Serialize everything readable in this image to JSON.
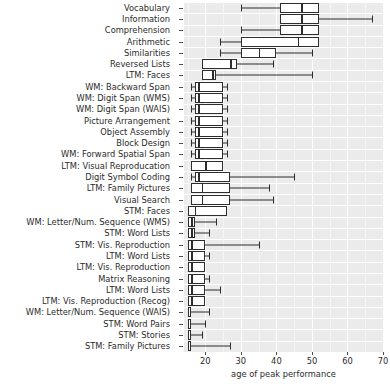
{
  "chart_data": {
    "type": "box",
    "title": "",
    "xlabel": "age of peak performance",
    "ylabel": "",
    "xlim": [
      14,
      70
    ],
    "xticks": [
      20,
      30,
      40,
      50,
      60,
      70
    ],
    "xticklabels": [
      "20",
      "30",
      "40",
      "50",
      "60",
      "70"
    ],
    "grid": true,
    "legend": "none",
    "orientation": "horizontal",
    "categories": [
      "Vocabulary",
      "Information",
      "Comprehension",
      "Arithmetic",
      "Similarities",
      "Reversed Lists",
      "LTM: Faces",
      "WM: Backward Span",
      "WM: Digit Span (WMS)",
      "WM: Digit Span (WAIS)",
      "Picture Arrangement",
      "Object Assembly",
      "Block Design",
      "WM: Forward Spatial Span",
      "LTM: Visual Reproducation",
      "Digit Symbol Coding",
      "LTM: Family Pictures",
      "Visual Search",
      "STM: Faces",
      "WM: Letter/Num. Sequence (WMS)",
      "STM: Word Lists",
      "STM: Vis. Reproduction",
      "LTM: Word Lists",
      "LTM: Vis. Reproduction",
      "Matrix Reasoning",
      "LTM: Word Lists",
      "LTM: Vis. Reproduction (Recog)",
      "WM: Letter/Num. Sequence (WAIS)",
      "STM: Word Pairs",
      "STM: Stories",
      "STM: Family Pictures"
    ],
    "boxes": [
      {
        "name": "Vocabulary",
        "whisker_low": 30,
        "q1": 41,
        "median": 47,
        "q3": 52,
        "whisker_high": 52
      },
      {
        "name": "Information",
        "whisker_low": 41,
        "q1": 41,
        "median": 47,
        "q3": 52,
        "whisker_high": 67
      },
      {
        "name": "Comprehension",
        "whisker_low": 30,
        "q1": 41,
        "median": 47,
        "q3": 52,
        "whisker_high": 52
      },
      {
        "name": "Arithmetic",
        "whisker_low": 24,
        "q1": 30,
        "median": 46,
        "q3": 52,
        "whisker_high": 52
      },
      {
        "name": "Similarities",
        "whisker_low": 24,
        "q1": 30,
        "median": 35,
        "q3": 40,
        "whisker_high": 50
      },
      {
        "name": "Reversed Lists",
        "whisker_low": 19,
        "q1": 19,
        "median": 27,
        "q3": 29,
        "whisker_high": 39
      },
      {
        "name": "LTM: Faces",
        "whisker_low": 19,
        "q1": 19,
        "median": 22,
        "q3": 23,
        "whisker_high": 50
      },
      {
        "name": "WM: Backward Span",
        "whisker_low": 16,
        "q1": 17,
        "median": 18,
        "q3": 25,
        "whisker_high": 26
      },
      {
        "name": "WM: Digit Span (WMS)",
        "whisker_low": 16,
        "q1": 17,
        "median": 18,
        "q3": 25,
        "whisker_high": 26
      },
      {
        "name": "WM: Digit Span (WAIS)",
        "whisker_low": 16,
        "q1": 17,
        "median": 18,
        "q3": 25,
        "whisker_high": 26
      },
      {
        "name": "Picture Arrangement",
        "whisker_low": 16,
        "q1": 17,
        "median": 18,
        "q3": 25,
        "whisker_high": 26
      },
      {
        "name": "Object Assembly",
        "whisker_low": 16,
        "q1": 17,
        "median": 18,
        "q3": 25,
        "whisker_high": 26
      },
      {
        "name": "Block Design",
        "whisker_low": 16,
        "q1": 17,
        "median": 18,
        "q3": 25,
        "whisker_high": 26
      },
      {
        "name": "WM: Forward Spatial Span",
        "whisker_low": 16,
        "q1": 17,
        "median": 18,
        "q3": 25,
        "whisker_high": 26
      },
      {
        "name": "LTM: Visual Reproducation",
        "whisker_low": 16,
        "q1": 16,
        "median": 20,
        "q3": 25,
        "whisker_high": 25
      },
      {
        "name": "Digit Symbol Coding",
        "whisker_low": 16,
        "q1": 17,
        "median": 18,
        "q3": 27,
        "whisker_high": 45
      },
      {
        "name": "LTM: Family Pictures",
        "whisker_low": 16,
        "q1": 16,
        "median": 19,
        "q3": 27,
        "whisker_high": 38
      },
      {
        "name": "Visual Search",
        "whisker_low": 16,
        "q1": 16,
        "median": 19,
        "q3": 27,
        "whisker_high": 39
      },
      {
        "name": "STM: Faces",
        "whisker_low": 15,
        "q1": 15,
        "median": 17,
        "q3": 26,
        "whisker_high": 26
      },
      {
        "name": "WM: Letter/Num. Sequence (WMS)",
        "whisker_low": 15,
        "q1": 15,
        "median": 16,
        "q3": 17,
        "whisker_high": 23
      },
      {
        "name": "STM: Word Lists",
        "whisker_low": 15,
        "q1": 15,
        "median": 16,
        "q3": 17,
        "whisker_high": 21
      },
      {
        "name": "STM: Vis. Reproduction",
        "whisker_low": 15,
        "q1": 15,
        "median": 16,
        "q3": 20,
        "whisker_high": 35
      },
      {
        "name": "LTM: Word Lists",
        "whisker_low": 15,
        "q1": 15,
        "median": 16,
        "q3": 20,
        "whisker_high": 21
      },
      {
        "name": "LTM: Vis. Reproduction",
        "whisker_low": 15,
        "q1": 15,
        "median": 16,
        "q3": 20,
        "whisker_high": 20
      },
      {
        "name": "Matrix Reasoning",
        "whisker_low": 15,
        "q1": 15,
        "median": 16,
        "q3": 20,
        "whisker_high": 21
      },
      {
        "name": "LTM: Word Lists",
        "whisker_low": 15,
        "q1": 15,
        "median": 16,
        "q3": 20,
        "whisker_high": 24
      },
      {
        "name": "LTM: Vis. Reproduction (Recog)",
        "whisker_low": 15,
        "q1": 15,
        "median": 16,
        "q3": 20,
        "whisker_high": 20
      },
      {
        "name": "WM: Letter/Num. Sequence (WAIS)",
        "whisker_low": 15,
        "q1": 15,
        "median": 15,
        "q3": 16,
        "whisker_high": 21
      },
      {
        "name": "STM: Word Pairs",
        "whisker_low": 15,
        "q1": 15,
        "median": 15,
        "q3": 16,
        "whisker_high": 20
      },
      {
        "name": "STM: Stories",
        "whisker_low": 15,
        "q1": 15,
        "median": 15,
        "q3": 16,
        "whisker_high": 19
      },
      {
        "name": "STM: Family Pictures",
        "whisker_low": 15,
        "q1": 15,
        "median": 15,
        "q3": 16,
        "whisker_high": 27
      }
    ],
    "colors": {
      "panel_background": "#ebebeb",
      "gridline": "#ffffff",
      "box_fill": "#ffffff",
      "box_stroke": "#2d2d2d",
      "text": "#2b2b2b"
    }
  }
}
